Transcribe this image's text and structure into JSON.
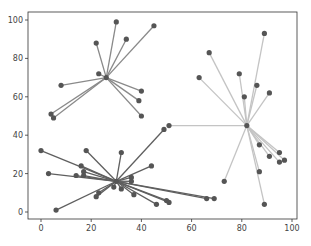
{
  "chart_data": {
    "type": "scatter",
    "title": "",
    "xlabel": "",
    "ylabel": "",
    "xlim": [
      -5,
      102
    ],
    "ylim": [
      -4,
      105
    ],
    "grid": false,
    "legend": null,
    "xticks": [
      0,
      20,
      40,
      60,
      80,
      100
    ],
    "yticks": [
      0,
      20,
      40,
      60,
      80,
      100
    ],
    "series": [
      {
        "name": "cluster-top-left",
        "line_color": "#8a8a8a",
        "center": [
          26,
          70
        ],
        "points": [
          [
            4,
            51
          ],
          [
            5,
            49
          ],
          [
            8,
            66
          ],
          [
            22,
            88
          ],
          [
            23,
            72
          ],
          [
            30,
            99
          ],
          [
            34,
            90
          ],
          [
            45,
            97
          ],
          [
            40,
            63
          ],
          [
            39,
            58
          ],
          [
            40,
            50
          ]
        ]
      },
      {
        "name": "cluster-right",
        "line_color": "#c4c4c4",
        "center": [
          82,
          45
        ],
        "points": [
          [
            63,
            70
          ],
          [
            67,
            83
          ],
          [
            79,
            72
          ],
          [
            81,
            60
          ],
          [
            86,
            66
          ],
          [
            89,
            93
          ],
          [
            91,
            62
          ],
          [
            87,
            35
          ],
          [
            91,
            29
          ],
          [
            95,
            31
          ],
          [
            95,
            26
          ],
          [
            97,
            27
          ],
          [
            87,
            21
          ],
          [
            73,
            16
          ],
          [
            89,
            4
          ],
          [
            51,
            45
          ]
        ]
      },
      {
        "name": "cluster-bottom",
        "line_color": "#5f5f5f",
        "center": [
          30,
          16
        ],
        "points": [
          [
            0,
            32
          ],
          [
            3,
            20
          ],
          [
            14,
            19
          ],
          [
            18,
            32
          ],
          [
            16,
            24
          ],
          [
            17,
            21
          ],
          [
            17,
            19
          ],
          [
            32,
            31
          ],
          [
            36,
            18
          ],
          [
            36,
            16
          ],
          [
            44,
            24
          ],
          [
            49,
            43
          ],
          [
            32,
            12
          ],
          [
            37,
            9
          ],
          [
            22,
            8
          ],
          [
            23,
            10
          ],
          [
            6,
            1
          ],
          [
            46,
            4
          ],
          [
            51,
            5
          ],
          [
            50,
            6
          ],
          [
            66,
            7
          ],
          [
            69,
            7
          ],
          [
            29,
            13
          ]
        ]
      }
    ],
    "marker_color": "#555555"
  }
}
